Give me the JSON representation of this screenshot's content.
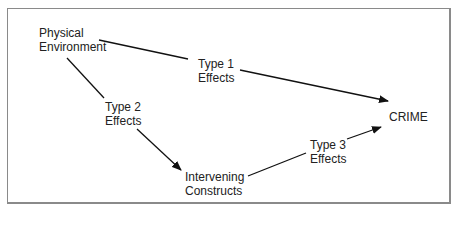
{
  "diagram": {
    "nodes": [
      {
        "id": "physical_environment",
        "label": "Physical\nEnvironment"
      },
      {
        "id": "intervening_constructs",
        "label": "Intervening\nConstructs"
      },
      {
        "id": "crime",
        "label": "CRIME"
      }
    ],
    "edges": [
      {
        "from": "physical_environment",
        "to": "crime",
        "label": "Type 1\nEffects"
      },
      {
        "from": "physical_environment",
        "to": "intervening_constructs",
        "label": "Type 2\nEffects"
      },
      {
        "from": "intervening_constructs",
        "to": "crime",
        "label": "Type 3\nEffects"
      }
    ]
  }
}
